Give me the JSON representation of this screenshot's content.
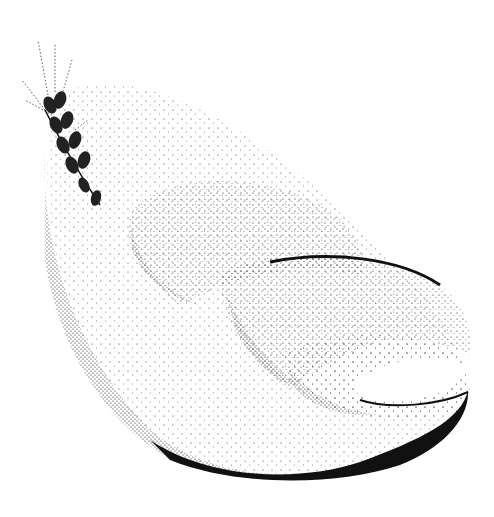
{
  "illustration": {
    "subject": "Stippled drawing of a wheat ear beside stacked bread loaves",
    "background_color": "#ffffff",
    "ink_color": "#111111",
    "elements": [
      "wheat-ear",
      "outer-bread-shell",
      "large-loaf",
      "middle-loaf",
      "small-loaf"
    ]
  }
}
